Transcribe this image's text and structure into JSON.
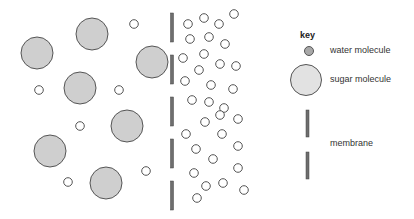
{
  "diagram": {
    "colors": {
      "sugar_fill": "#cfcfcf",
      "stroke": "#555555",
      "membrane": "#6e6e6e",
      "water_key_fill": "#a8a8a8"
    },
    "sugar_molecules": [
      [
        37,
        53
      ],
      [
        92,
        34
      ],
      [
        152,
        62
      ],
      [
        80,
        88
      ],
      [
        127,
        126
      ],
      [
        50,
        151
      ],
      [
        106,
        183
      ]
    ],
    "water_left": [
      [
        134,
        24
      ],
      [
        39,
        90
      ],
      [
        119,
        90
      ],
      [
        80,
        126
      ],
      [
        68,
        182
      ],
      [
        146,
        171
      ]
    ],
    "membrane_segments": [
      [
        13,
        42
      ],
      [
        55,
        84
      ],
      [
        97,
        126
      ],
      [
        139,
        168
      ],
      [
        181,
        210
      ]
    ],
    "water_right": [
      [
        188,
        24
      ],
      [
        204,
        18
      ],
      [
        219,
        24
      ],
      [
        234,
        14
      ],
      [
        190,
        39
      ],
      [
        209,
        37
      ],
      [
        225,
        44
      ],
      [
        183,
        58
      ],
      [
        204,
        54
      ],
      [
        220,
        64
      ],
      [
        236,
        66
      ],
      [
        199,
        70
      ],
      [
        185,
        81
      ],
      [
        211,
        85
      ],
      [
        233,
        89
      ],
      [
        192,
        100
      ],
      [
        209,
        102
      ],
      [
        224,
        108
      ],
      [
        205,
        122
      ],
      [
        220,
        115
      ],
      [
        238,
        119
      ],
      [
        186,
        134
      ],
      [
        222,
        134
      ],
      [
        196,
        149
      ],
      [
        238,
        146
      ],
      [
        213,
        159
      ],
      [
        238,
        168
      ],
      [
        194,
        173
      ],
      [
        206,
        186
      ],
      [
        223,
        183
      ],
      [
        244,
        190
      ],
      [
        197,
        198
      ]
    ]
  },
  "key": {
    "title": "key",
    "water": "water molecule",
    "sugar": "sugar molecule",
    "membrane": "membrane"
  }
}
